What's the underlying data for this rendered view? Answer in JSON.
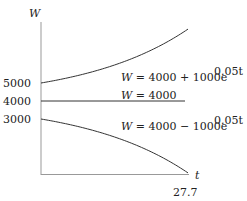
{
  "chart_data": {
    "type": "line",
    "title": "",
    "xlabel": "t",
    "ylabel": "W",
    "x_ticks": [
      "27.7"
    ],
    "y_ticks": [
      "5000",
      "4000",
      "3000"
    ],
    "xlim": [
      0,
      27.7
    ],
    "ylim": [
      0,
      8000
    ],
    "grid": false,
    "legend": "inline annotations",
    "series": [
      {
        "name": "W = 4000 + 1000e^{0.05t}",
        "label_main": "W = 4000 + 1000e",
        "label_exp": "0.05t",
        "formula": "4000+1000*exp(0.05*t)",
        "x": [
          0,
          5,
          10,
          15,
          20,
          25,
          27.7
        ],
        "values": [
          5000,
          5284,
          5649,
          6117,
          6718,
          7490,
          7996
        ]
      },
      {
        "name": "W = 4000",
        "label_main": "W = 4000",
        "label_exp": "",
        "formula": "4000",
        "x": [
          0,
          27.7
        ],
        "values": [
          4000,
          4000
        ]
      },
      {
        "name": "W = 4000 - 1000e^{0.05t}",
        "label_main": "W = 4000 − 1000e",
        "label_exp": "0.05t",
        "formula": "4000-1000*exp(0.05*t)",
        "x": [
          0,
          5,
          10,
          15,
          20,
          25,
          27.7
        ],
        "values": [
          3000,
          2716,
          2351,
          1883,
          1282,
          510,
          4
        ]
      }
    ]
  },
  "axis": {
    "x_label": "t",
    "y_label": "W",
    "x_end_tick": "27.7",
    "y_tick_5000": "5000",
    "y_tick_4000": "4000",
    "y_tick_3000": "3000"
  }
}
